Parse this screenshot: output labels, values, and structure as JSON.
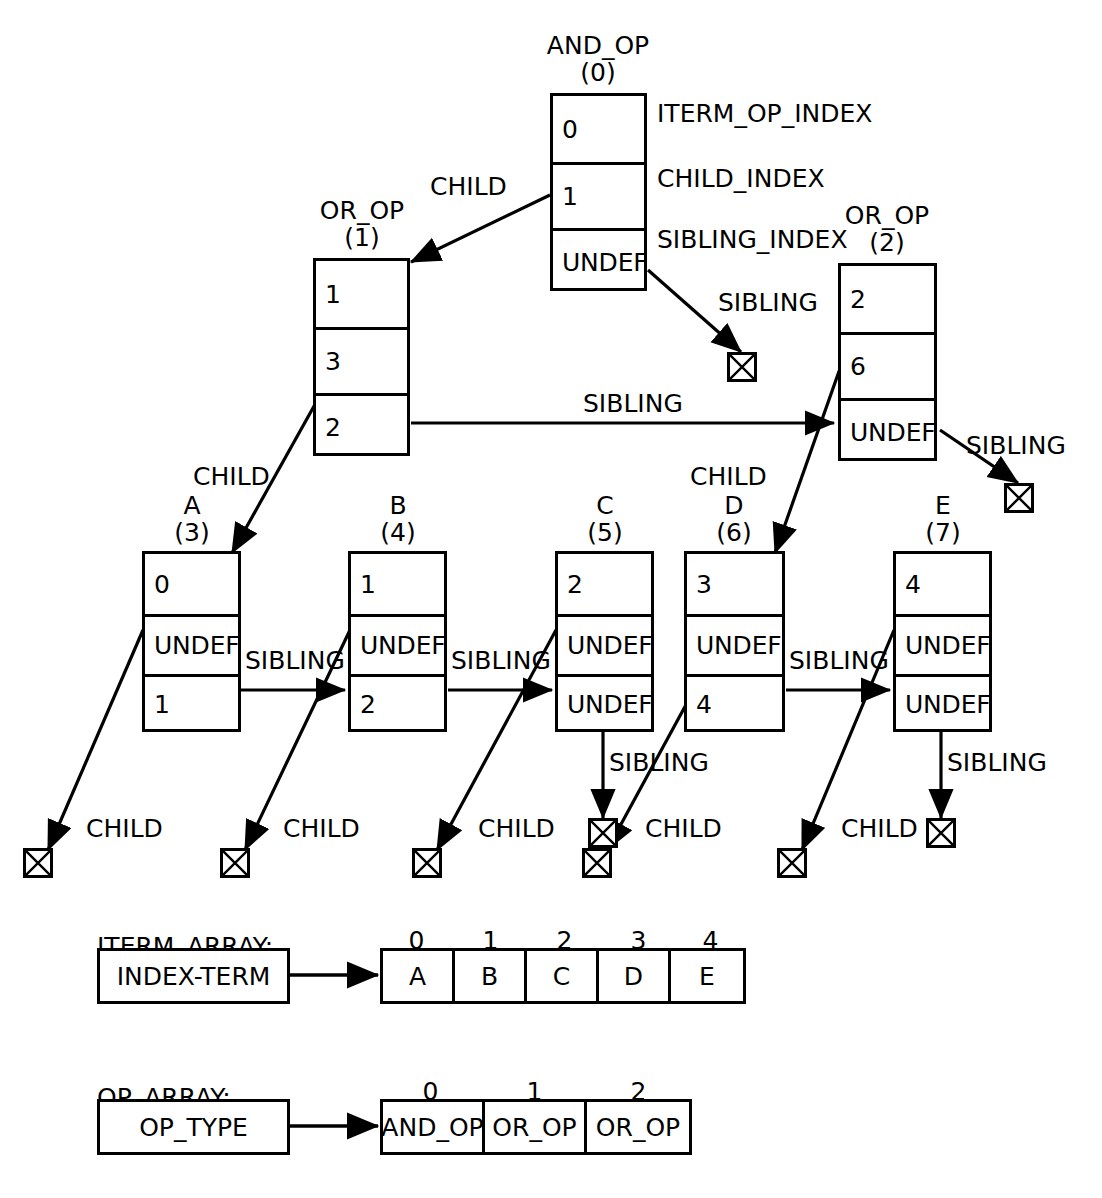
{
  "diagram": {
    "field_labels": {
      "iterm_op_index": "ITERM_OP_INDEX",
      "child_index": "CHILD_INDEX",
      "sibling_index": "SIBLING_INDEX"
    },
    "edge_labels": {
      "child": "CHILD",
      "sibling": "SIBLING"
    },
    "nodes": [
      {
        "id": "n0",
        "name": "AND_OP",
        "index": "(0)",
        "iterm_op_index": "0",
        "child_index": "1",
        "sibling_index": "UNDEF"
      },
      {
        "id": "n1",
        "name": "OR_OP",
        "index": "(1)",
        "iterm_op_index": "1",
        "child_index": "3",
        "sibling_index": "2"
      },
      {
        "id": "n2",
        "name": "OR_OP",
        "index": "(2)",
        "iterm_op_index": "2",
        "child_index": "6",
        "sibling_index": "UNDEF"
      },
      {
        "id": "n3",
        "name": "A",
        "index": "(3)",
        "iterm_op_index": "0",
        "child_index": "UNDEF",
        "sibling_index": "1"
      },
      {
        "id": "n4",
        "name": "B",
        "index": "(4)",
        "iterm_op_index": "1",
        "child_index": "UNDEF",
        "sibling_index": "2"
      },
      {
        "id": "n5",
        "name": "C",
        "index": "(5)",
        "iterm_op_index": "2",
        "child_index": "UNDEF",
        "sibling_index": "UNDEF"
      },
      {
        "id": "n6",
        "name": "D",
        "index": "(6)",
        "iterm_op_index": "3",
        "child_index": "UNDEF",
        "sibling_index": "4"
      },
      {
        "id": "n7",
        "name": "E",
        "index": "(7)",
        "iterm_op_index": "4",
        "child_index": "UNDEF",
        "sibling_index": "UNDEF"
      }
    ],
    "edges": [
      {
        "from": "n0",
        "to": "n1",
        "label": "CHILD"
      },
      {
        "from": "n0",
        "to": "null-sibling-0",
        "label": "SIBLING"
      },
      {
        "from": "n1",
        "to": "n3",
        "label": "CHILD"
      },
      {
        "from": "n1",
        "to": "n2",
        "label": "SIBLING"
      },
      {
        "from": "n2",
        "to": "n6",
        "label": "CHILD"
      },
      {
        "from": "n2",
        "to": "null-sibling-2",
        "label": "SIBLING"
      },
      {
        "from": "n3",
        "to": "n4",
        "label": "SIBLING"
      },
      {
        "from": "n3",
        "to": "null-child-a",
        "label": "CHILD"
      },
      {
        "from": "n4",
        "to": "n5",
        "label": "SIBLING"
      },
      {
        "from": "n4",
        "to": "null-child-b",
        "label": "CHILD"
      },
      {
        "from": "n5",
        "to": "null-sibling-c",
        "label": "SIBLING"
      },
      {
        "from": "n5",
        "to": "null-child-c",
        "label": "CHILD"
      },
      {
        "from": "n6",
        "to": "n7",
        "label": "SIBLING"
      },
      {
        "from": "n6",
        "to": "null-child-d",
        "label": "CHILD"
      },
      {
        "from": "n7",
        "to": "null-sibling-e",
        "label": "SIBLING"
      },
      {
        "from": "n7",
        "to": "null-child-e",
        "label": "CHILD"
      }
    ],
    "iterm_array": {
      "title": "ITERM_ARRAY:",
      "source_label": "INDEX-TERM",
      "indices": [
        "0",
        "1",
        "2",
        "3",
        "4"
      ],
      "values": [
        "A",
        "B",
        "C",
        "D",
        "E"
      ]
    },
    "op_array": {
      "title": "OP_ARRAY:",
      "source_label": "OP_TYPE",
      "indices": [
        "0",
        "1",
        "2"
      ],
      "values": [
        "AND_OP",
        "OR_OP",
        "OR_OP"
      ]
    },
    "colors": {
      "stroke": "#000000",
      "background": "#ffffff"
    }
  }
}
